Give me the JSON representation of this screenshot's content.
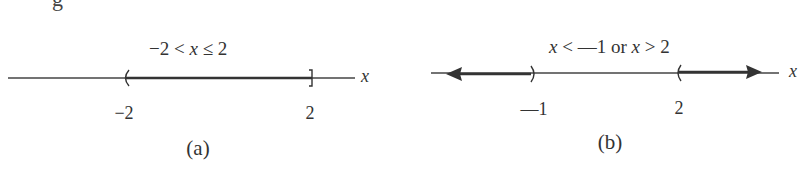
{
  "fragment_text": "g",
  "panels": [
    {
      "id": "a",
      "inequality": "−2 < x ≤ 2",
      "inequality_parts": [
        "−2 < ",
        "x",
        " ≤ 2"
      ],
      "axis_label": "x",
      "endpoints": [
        {
          "value": "−2",
          "bracket": "(",
          "type": "open"
        },
        {
          "value": "2",
          "bracket": "]",
          "type": "closed"
        }
      ],
      "shaded": "between",
      "caption": "(a)"
    },
    {
      "id": "b",
      "inequality": "x < —1 or x > 2",
      "inequality_parts": [
        "x",
        " < —1 or ",
        "x",
        " > 2"
      ],
      "axis_label": "x",
      "endpoints": [
        {
          "value": "—1",
          "bracket": ")",
          "type": "open"
        },
        {
          "value": "2",
          "bracket": "(",
          "type": "open"
        }
      ],
      "shaded": "outside",
      "caption": "(b)"
    }
  ]
}
